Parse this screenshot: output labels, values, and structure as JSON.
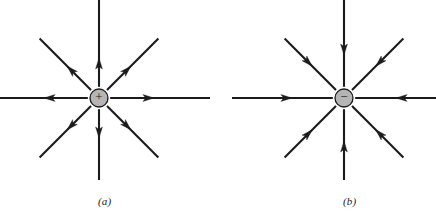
{
  "figure": {
    "width": 436,
    "height": 217,
    "background_color": "#ffffff",
    "line_color": "#1b1b1b",
    "charge_fill_color": "#b5b5b5",
    "charge_stroke_color": "#1b1b1b"
  },
  "panels": [
    {
      "id": "a",
      "caption": "(a)",
      "charge_sign": "+",
      "charge_symbol": "plus-sign",
      "charge_polarity": "positive",
      "center": {
        "x": 99,
        "y": 98
      },
      "charge_radius": 9,
      "field_direction": "outward",
      "line_count": 8,
      "lines": [
        {
          "name": "field-line-right",
          "angle_deg": 0,
          "inner": 11,
          "outer": 111,
          "arrow_at": 55,
          "arrow_points": "outward"
        },
        {
          "name": "field-line-up-right",
          "angle_deg": 45,
          "inner": 11,
          "outer": 84,
          "arrow_at": 45,
          "arrow_points": "outward"
        },
        {
          "name": "field-line-up",
          "angle_deg": 90,
          "inner": 11,
          "outer": 100,
          "arrow_at": 40,
          "arrow_points": "outward"
        },
        {
          "name": "field-line-up-left",
          "angle_deg": 135,
          "inner": 11,
          "outer": 84,
          "arrow_at": 45,
          "arrow_points": "outward"
        },
        {
          "name": "field-line-left",
          "angle_deg": 180,
          "inner": 11,
          "outer": 101,
          "arrow_at": 55,
          "arrow_points": "outward"
        },
        {
          "name": "field-line-down-left",
          "angle_deg": 225,
          "inner": 11,
          "outer": 84,
          "arrow_at": 45,
          "arrow_points": "outward"
        },
        {
          "name": "field-line-down",
          "angle_deg": 270,
          "inner": 11,
          "outer": 82,
          "arrow_at": 40,
          "arrow_points": "outward"
        },
        {
          "name": "field-line-down-right",
          "angle_deg": 315,
          "inner": 11,
          "outer": 84,
          "arrow_at": 45,
          "arrow_points": "outward"
        }
      ]
    },
    {
      "id": "b",
      "caption": "(b)",
      "charge_sign": "−",
      "charge_symbol": "minus-sign",
      "charge_polarity": "negative",
      "center": {
        "x": 344,
        "y": 98
      },
      "charge_radius": 9,
      "field_direction": "inward",
      "line_count": 8,
      "lines": [
        {
          "name": "field-line-right",
          "angle_deg": 0,
          "inner": 11,
          "outer": 92,
          "arrow_at": 52,
          "arrow_points": "inward"
        },
        {
          "name": "field-line-up-right",
          "angle_deg": 45,
          "inner": 11,
          "outer": 84,
          "arrow_at": 45,
          "arrow_points": "inward"
        },
        {
          "name": "field-line-up",
          "angle_deg": 90,
          "inner": 11,
          "outer": 98,
          "arrow_at": 43,
          "arrow_points": "inward"
        },
        {
          "name": "field-line-up-left",
          "angle_deg": 135,
          "inner": 11,
          "outer": 84,
          "arrow_at": 45,
          "arrow_points": "inward"
        },
        {
          "name": "field-line-left",
          "angle_deg": 180,
          "inner": 11,
          "outer": 112,
          "arrow_at": 52,
          "arrow_points": "inward"
        },
        {
          "name": "field-line-down-left",
          "angle_deg": 225,
          "inner": 11,
          "outer": 84,
          "arrow_at": 45,
          "arrow_points": "inward"
        },
        {
          "name": "field-line-down",
          "angle_deg": 270,
          "inner": 11,
          "outer": 82,
          "arrow_at": 43,
          "arrow_points": "inward"
        },
        {
          "name": "field-line-down-right",
          "angle_deg": 315,
          "inner": 11,
          "outer": 84,
          "arrow_at": 45,
          "arrow_points": "inward"
        }
      ]
    }
  ]
}
